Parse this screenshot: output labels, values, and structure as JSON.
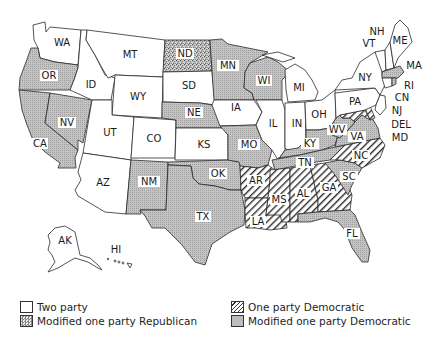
{
  "map": {
    "title": "",
    "categories": {
      "two_party": {
        "label": "Two party",
        "color": "#ffffff"
      },
      "modified_one_party_republican": {
        "label": "Modified one party Republican",
        "color": "#9a9a9a",
        "pattern": "stipple"
      },
      "one_party_democratic": {
        "label": "One party Democratic",
        "color": "#ffffff",
        "pattern": "diagonal-hatch"
      },
      "modified_one_party_democratic": {
        "label": "Modified one party Democratic",
        "color": "#bdbdbd",
        "pattern": "fine-dot"
      }
    },
    "states": [
      {
        "abbr": "WA",
        "category": "two_party"
      },
      {
        "abbr": "OR",
        "category": "modified_one_party_democratic"
      },
      {
        "abbr": "CA",
        "category": "modified_one_party_democratic"
      },
      {
        "abbr": "NV",
        "category": "modified_one_party_democratic"
      },
      {
        "abbr": "ID",
        "category": "two_party"
      },
      {
        "abbr": "MT",
        "category": "two_party"
      },
      {
        "abbr": "WY",
        "category": "two_party"
      },
      {
        "abbr": "UT",
        "category": "two_party"
      },
      {
        "abbr": "AZ",
        "category": "two_party"
      },
      {
        "abbr": "CO",
        "category": "two_party"
      },
      {
        "abbr": "NM",
        "category": "modified_one_party_democratic"
      },
      {
        "abbr": "ND",
        "category": "modified_one_party_republican"
      },
      {
        "abbr": "SD",
        "category": "two_party"
      },
      {
        "abbr": "NE",
        "category": "modified_one_party_democratic"
      },
      {
        "abbr": "KS",
        "category": "two_party"
      },
      {
        "abbr": "OK",
        "category": "modified_one_party_democratic"
      },
      {
        "abbr": "TX",
        "category": "modified_one_party_democratic"
      },
      {
        "abbr": "MN",
        "category": "modified_one_party_democratic"
      },
      {
        "abbr": "IA",
        "category": "two_party"
      },
      {
        "abbr": "MO",
        "category": "modified_one_party_democratic"
      },
      {
        "abbr": "AR",
        "category": "one_party_democratic"
      },
      {
        "abbr": "LA",
        "category": "one_party_democratic"
      },
      {
        "abbr": "WI",
        "category": "modified_one_party_democratic"
      },
      {
        "abbr": "IL",
        "category": "two_party"
      },
      {
        "abbr": "MI",
        "category": "two_party"
      },
      {
        "abbr": "IN",
        "category": "two_party"
      },
      {
        "abbr": "OH",
        "category": "two_party"
      },
      {
        "abbr": "KY",
        "category": "modified_one_party_democratic"
      },
      {
        "abbr": "TN",
        "category": "modified_one_party_democratic"
      },
      {
        "abbr": "MS",
        "category": "one_party_democratic"
      },
      {
        "abbr": "AL",
        "category": "one_party_democratic"
      },
      {
        "abbr": "GA",
        "category": "one_party_democratic"
      },
      {
        "abbr": "FL",
        "category": "modified_one_party_democratic"
      },
      {
        "abbr": "SC",
        "category": "modified_one_party_democratic"
      },
      {
        "abbr": "NC",
        "category": "one_party_democratic"
      },
      {
        "abbr": "VA",
        "category": "modified_one_party_democratic"
      },
      {
        "abbr": "WV",
        "category": "modified_one_party_democratic"
      },
      {
        "abbr": "PA",
        "category": "two_party"
      },
      {
        "abbr": "NY",
        "category": "two_party"
      },
      {
        "abbr": "VT",
        "category": "two_party"
      },
      {
        "abbr": "NH",
        "category": "two_party"
      },
      {
        "abbr": "ME",
        "category": "two_party"
      },
      {
        "abbr": "MA",
        "category": "modified_one_party_democratic"
      },
      {
        "abbr": "RI",
        "category": "modified_one_party_democratic"
      },
      {
        "abbr": "CN",
        "category": "two_party"
      },
      {
        "abbr": "NJ",
        "category": "two_party"
      },
      {
        "abbr": "DEL",
        "category": "one_party_democratic"
      },
      {
        "abbr": "MD",
        "category": "one_party_democratic"
      },
      {
        "abbr": "AK",
        "category": "two_party"
      },
      {
        "abbr": "HI",
        "category": "two_party"
      }
    ],
    "labels": {
      "WA": "WA",
      "OR": "OR",
      "CA": "CA",
      "NV": "NV",
      "ID": "ID",
      "MT": "MT",
      "WY": "WY",
      "UT": "UT",
      "AZ": "AZ",
      "CO": "CO",
      "NM": "NM",
      "ND": "ND",
      "SD": "SD",
      "NE": "NE",
      "KS": "KS",
      "OK": "OK",
      "TX": "TX",
      "MN": "MN",
      "IA": "IA",
      "MO": "MO",
      "AR": "AR",
      "LA": "LA",
      "WI": "WI",
      "IL": "IL",
      "MI": "MI",
      "IN": "IN",
      "OH": "OH",
      "KY": "KY",
      "TN": "TN",
      "MS": "MS",
      "AL": "AL",
      "GA": "GA",
      "FL": "FL",
      "SC": "SC",
      "NC": "NC",
      "VA": "VA",
      "WV": "WV",
      "PA": "PA",
      "NY": "NY",
      "VT": "VT",
      "NH": "NH",
      "ME": "ME",
      "MA": "MA",
      "RI": "RI",
      "CN": "CN",
      "NJ": "NJ",
      "DEL": "DEL",
      "MD": "MD",
      "AK": "AK",
      "HI": "HI"
    }
  },
  "legend": {
    "items": [
      {
        "label": "Two party"
      },
      {
        "label": "Modified one party Republican"
      },
      {
        "label": "One party Democratic"
      },
      {
        "label": "Modified one party Democratic"
      }
    ]
  }
}
